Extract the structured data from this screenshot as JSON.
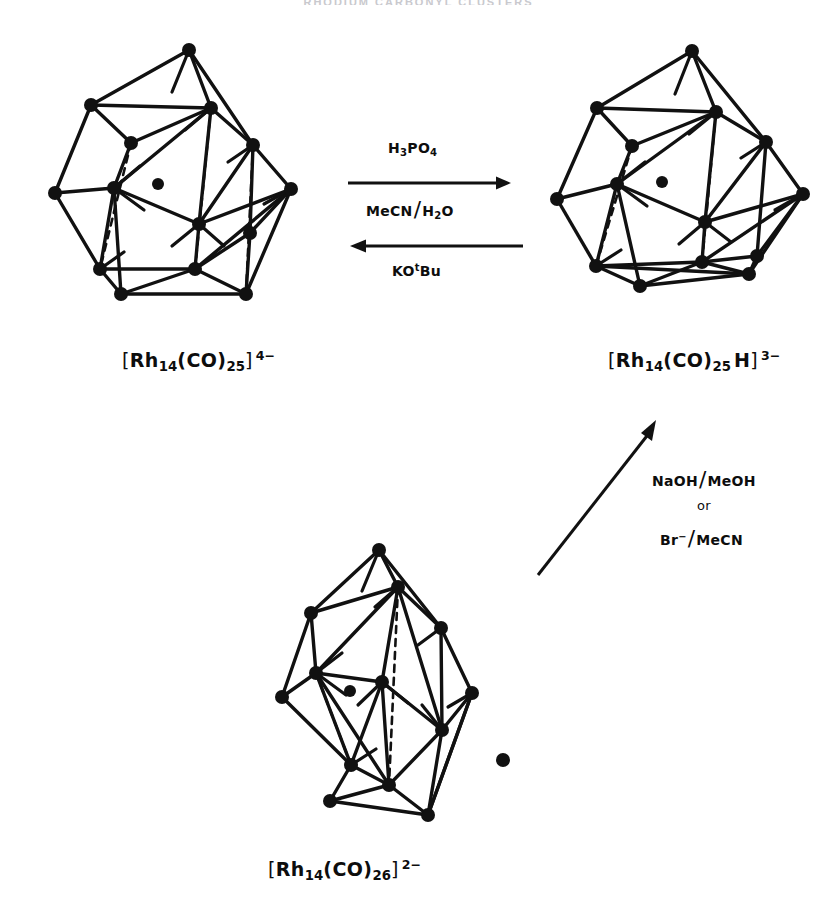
{
  "page": {
    "running_head": "RHODIUM CARBONYL CLUSTERS",
    "background": "#ffffff",
    "ink": "#111111",
    "width": 837,
    "height": 911
  },
  "scheme": {
    "title": "Interconversion of Rh14 carbonyl cluster anions",
    "species": [
      {
        "id": "rh14co25-4minus",
        "label_plain": "[Rh14(CO)25]4-",
        "open_bracket": "[",
        "element": "Rh",
        "metal_count": "14",
        "ligand_open": "(CO)",
        "ligand_count": "25",
        "hydride": "",
        "close_bracket": "]",
        "charge": "4–",
        "position": "top-left"
      },
      {
        "id": "rh14co25h-3minus",
        "label_plain": "[Rh14(CO)25H]3-",
        "open_bracket": "[",
        "element": "Rh",
        "metal_count": "14",
        "ligand_open": "(CO)",
        "ligand_count": "25",
        "hydride": "H",
        "close_bracket": "]",
        "charge": "3–",
        "position": "top-right"
      },
      {
        "id": "rh14co26-2minus",
        "label_plain": "[Rh14(CO)26]2-",
        "open_bracket": "[",
        "element": "Rh",
        "metal_count": "14",
        "ligand_open": "(CO)",
        "ligand_count": "26",
        "hydride": "",
        "close_bracket": "]",
        "charge": "2–",
        "position": "bottom-centre"
      }
    ],
    "reactions": [
      {
        "id": "forward-protonation",
        "direction": "left-to-right",
        "above_label": {
          "formula": "H3PO4",
          "parts": [
            "H",
            "3",
            "PO",
            "4"
          ]
        },
        "below_label": {
          "formula": "MeCN/H2O",
          "left": "MeCN",
          "right_stem": "H",
          "right_sub": "2",
          "right_tail": "O"
        }
      },
      {
        "id": "reverse-deprotonation",
        "direction": "right-to-left",
        "below_label": {
          "formula": "KOtBu",
          "stem": "KO",
          "superscript": "t",
          "tail": "Bu"
        }
      },
      {
        "id": "diagonal-conversion",
        "direction": "bottom-left-to-top-right",
        "labels": [
          {
            "line": 1,
            "formula": "NaOH/MeOH",
            "left": "NaOH",
            "right": "MeOH"
          },
          {
            "line": 2,
            "formula": "or",
            "left": "or",
            "right": ""
          },
          {
            "line": 3,
            "formula": "Br-/MeCN",
            "left": "Br",
            "left_sup": "–",
            "right": "MeCN"
          }
        ]
      }
    ]
  },
  "clusters": {
    "topLeft": {
      "name": "rh14-cluster-top-left",
      "vertices": [
        [
          137,
          16
        ],
        [
          39,
          71
        ],
        [
          159,
          74
        ],
        [
          201,
          111
        ],
        [
          79,
          109
        ],
        [
          3,
          159
        ],
        [
          62,
          154
        ],
        [
          147,
          190
        ],
        [
          239,
          155
        ],
        [
          198,
          199
        ],
        [
          48,
          235
        ],
        [
          143,
          235
        ],
        [
          194,
          260
        ],
        [
          69,
          260
        ]
      ],
      "interstitial": [
        106,
        150
      ],
      "solid_edges": [
        [
          0,
          1
        ],
        [
          0,
          2
        ],
        [
          0,
          3
        ],
        [
          1,
          2
        ],
        [
          2,
          3
        ],
        [
          1,
          4
        ],
        [
          4,
          2
        ],
        [
          4,
          6
        ],
        [
          6,
          2
        ],
        [
          1,
          5
        ],
        [
          5,
          6
        ],
        [
          5,
          10
        ],
        [
          6,
          10
        ],
        [
          6,
          7
        ],
        [
          7,
          2
        ],
        [
          7,
          3
        ],
        [
          3,
          8
        ],
        [
          8,
          7
        ],
        [
          7,
          11
        ],
        [
          11,
          8
        ],
        [
          8,
          12
        ],
        [
          12,
          11
        ],
        [
          10,
          11
        ],
        [
          10,
          13
        ],
        [
          13,
          12
        ],
        [
          11,
          13
        ],
        [
          6,
          13
        ],
        [
          12,
          8
        ],
        [
          9,
          11
        ],
        [
          9,
          12
        ],
        [
          3,
          9
        ],
        [
          9,
          8
        ]
      ],
      "dashed_edges": [
        [
          4,
          10
        ],
        [
          2,
          11
        ],
        [
          3,
          12
        ],
        [
          6,
          7
        ]
      ],
      "stub_edges": [
        [
          [
            159,
            74
          ],
          [
            133,
            96
          ]
        ],
        [
          [
            137,
            16
          ],
          [
            120,
            58
          ]
        ],
        [
          [
            62,
            154
          ],
          [
            88,
            132
          ]
        ],
        [
          [
            62,
            154
          ],
          [
            92,
            176
          ]
        ],
        [
          [
            147,
            190
          ],
          [
            120,
            212
          ]
        ],
        [
          [
            147,
            190
          ],
          [
            172,
            212
          ]
        ],
        [
          [
            48,
            235
          ],
          [
            72,
            218
          ]
        ],
        [
          [
            201,
            111
          ],
          [
            176,
            128
          ]
        ],
        [
          [
            239,
            155
          ],
          [
            212,
            170
          ]
        ]
      ]
    },
    "topRight": {
      "name": "rh14-cluster-top-right",
      "vertices": [
        [
          139,
          17
        ],
        [
          44,
          74
        ],
        [
          163,
          78
        ],
        [
          213,
          108
        ],
        [
          79,
          112
        ],
        [
          4,
          165
        ],
        [
          64,
          150
        ],
        [
          152,
          188
        ],
        [
          250,
          160
        ],
        [
          204,
          222
        ],
        [
          43,
          232
        ],
        [
          149,
          228
        ],
        [
          196,
          240
        ],
        [
          87,
          252
        ]
      ],
      "interstitial": [
        109,
        148
      ],
      "solid_edges": [
        [
          0,
          1
        ],
        [
          0,
          2
        ],
        [
          0,
          3
        ],
        [
          1,
          2
        ],
        [
          2,
          3
        ],
        [
          1,
          4
        ],
        [
          4,
          2
        ],
        [
          4,
          6
        ],
        [
          6,
          2
        ],
        [
          1,
          5
        ],
        [
          5,
          6
        ],
        [
          5,
          10
        ],
        [
          6,
          10
        ],
        [
          6,
          7
        ],
        [
          7,
          2
        ],
        [
          7,
          3
        ],
        [
          3,
          8
        ],
        [
          8,
          7
        ],
        [
          7,
          11
        ],
        [
          11,
          8
        ],
        [
          8,
          12
        ],
        [
          12,
          11
        ],
        [
          10,
          11
        ],
        [
          10,
          13
        ],
        [
          13,
          12
        ],
        [
          11,
          13
        ],
        [
          6,
          13
        ],
        [
          9,
          11
        ],
        [
          9,
          12
        ],
        [
          3,
          9
        ],
        [
          9,
          8
        ],
        [
          8,
          9
        ],
        [
          10,
          12
        ]
      ],
      "dashed_edges": [
        [
          4,
          10
        ],
        [
          2,
          11
        ]
      ],
      "stub_edges": [
        [
          [
            163,
            78
          ],
          [
            136,
            100
          ]
        ],
        [
          [
            139,
            17
          ],
          [
            122,
            60
          ]
        ],
        [
          [
            64,
            150
          ],
          [
            92,
            128
          ]
        ],
        [
          [
            64,
            150
          ],
          [
            94,
            172
          ]
        ],
        [
          [
            152,
            188
          ],
          [
            126,
            210
          ]
        ],
        [
          [
            152,
            188
          ],
          [
            178,
            208
          ]
        ],
        [
          [
            43,
            232
          ],
          [
            68,
            216
          ]
        ],
        [
          [
            213,
            108
          ],
          [
            188,
            124
          ]
        ],
        [
          [
            250,
            160
          ],
          [
            222,
            176
          ]
        ],
        [
          [
            204,
            222
          ],
          [
            184,
            196
          ]
        ]
      ]
    },
    "bottom": {
      "name": "rh14-cluster-bottom",
      "vertices": [
        [
          121,
          5
        ],
        [
          53,
          68
        ],
        [
          140,
          42
        ],
        [
          183,
          83
        ],
        [
          24,
          152
        ],
        [
          58,
          128
        ],
        [
          124,
          137
        ],
        [
          184,
          185
        ],
        [
          214,
          148
        ],
        [
          93,
          220
        ],
        [
          45,
          157
        ],
        [
          131,
          240
        ],
        [
          170,
          270
        ],
        [
          72,
          256
        ]
      ],
      "interstitial": [
        92,
        146
      ],
      "solid_edges": [
        [
          0,
          1
        ],
        [
          0,
          2
        ],
        [
          0,
          3
        ],
        [
          1,
          2
        ],
        [
          2,
          3
        ],
        [
          1,
          5
        ],
        [
          5,
          2
        ],
        [
          5,
          6
        ],
        [
          6,
          2
        ],
        [
          1,
          4
        ],
        [
          4,
          5
        ],
        [
          4,
          9
        ],
        [
          5,
          9
        ],
        [
          6,
          7
        ],
        [
          7,
          2
        ],
        [
          7,
          3
        ],
        [
          3,
          8
        ],
        [
          8,
          7
        ],
        [
          6,
          11
        ],
        [
          11,
          7
        ],
        [
          7,
          12
        ],
        [
          12,
          11
        ],
        [
          9,
          11
        ],
        [
          9,
          13
        ],
        [
          13,
          12
        ],
        [
          11,
          13
        ],
        [
          6,
          9
        ],
        [
          8,
          12
        ],
        [
          3,
          8
        ],
        [
          5,
          11
        ]
      ],
      "dashed_edges": [
        [
          5,
          9
        ],
        [
          2,
          11
        ]
      ],
      "stub_edges": [
        [
          [
            140,
            42
          ],
          [
            117,
            62
          ]
        ],
        [
          [
            121,
            5
          ],
          [
            104,
            46
          ]
        ],
        [
          [
            58,
            128
          ],
          [
            84,
            108
          ]
        ],
        [
          [
            58,
            128
          ],
          [
            88,
            150
          ]
        ],
        [
          [
            124,
            137
          ],
          [
            100,
            160
          ]
        ],
        [
          [
            124,
            137
          ],
          [
            150,
            158
          ]
        ],
        [
          [
            93,
            220
          ],
          [
            118,
            204
          ]
        ],
        [
          [
            183,
            83
          ],
          [
            160,
            100
          ]
        ],
        [
          [
            214,
            148
          ],
          [
            190,
            162
          ]
        ],
        [
          [
            184,
            185
          ],
          [
            164,
            160
          ]
        ]
      ]
    }
  }
}
